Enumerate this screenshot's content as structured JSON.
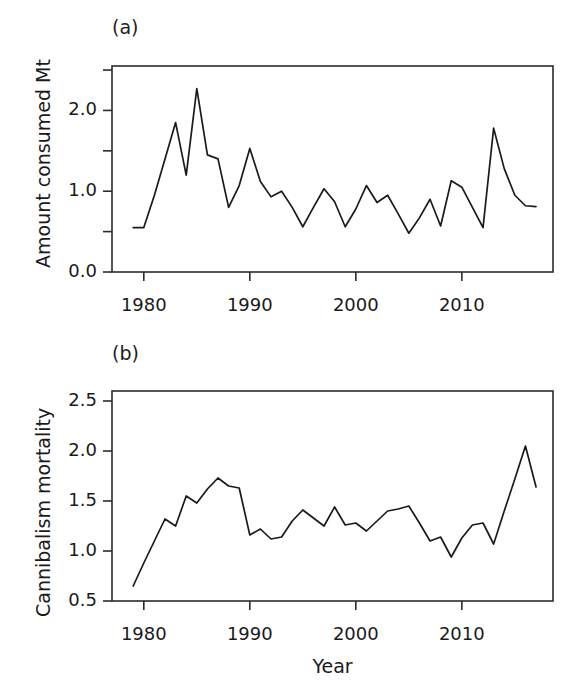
{
  "figure": {
    "background": "#ffffff",
    "line_color": "#1a1a1a",
    "axis_color": "#2b2b2b",
    "panels": [
      {
        "key": "a",
        "label": "(a)",
        "ylabel": "Amount consumed Mt",
        "xlabel": ""
      },
      {
        "key": "b",
        "label": "(b)",
        "ylabel": "Cannibalism mortality",
        "xlabel": "Year"
      }
    ]
  },
  "chart_data": [
    {
      "type": "line",
      "panel": "a",
      "title": "(a)",
      "xlabel": "",
      "ylabel": "Amount consumed Mt",
      "xlim": [
        1977.0,
        1919.0
      ],
      "ylim": [
        0.0,
        2.55
      ],
      "xticks": [
        1980,
        1990,
        2000,
        2010
      ],
      "xtick_labels": [
        "1980",
        "1990",
        "2000",
        "2010"
      ],
      "yticks": [
        0.0,
        0.5,
        1.0,
        1.5,
        2.0,
        2.5
      ],
      "ytick_labels": [
        "0.0",
        "",
        "1.0",
        "",
        "2.0",
        ""
      ],
      "grid": false,
      "legend": "none",
      "x": [
        1979,
        1980,
        1981,
        1982,
        1983,
        1984,
        1985,
        1986,
        1987,
        1988,
        1989,
        1990,
        1991,
        1992,
        1993,
        1994,
        1995,
        1996,
        1997,
        1998,
        1999,
        2000,
        2001,
        2002,
        2003,
        2004,
        2005,
        2006,
        2007,
        2008,
        2009,
        2010,
        2011,
        2012,
        2013,
        2014,
        2015,
        2016,
        2017
      ],
      "values": [
        0.55,
        0.55,
        0.95,
        1.4,
        1.85,
        1.2,
        2.27,
        1.45,
        1.4,
        0.8,
        1.07,
        1.53,
        1.12,
        0.93,
        1.0,
        0.8,
        0.56,
        0.8,
        1.03,
        0.87,
        0.56,
        0.78,
        1.07,
        0.86,
        0.95,
        0.72,
        0.48,
        0.67,
        0.9,
        0.57,
        1.13,
        1.05,
        0.8,
        0.55,
        1.78,
        1.28,
        0.95,
        0.82,
        0.81
      ]
    },
    {
      "type": "line",
      "panel": "b",
      "title": "(b)",
      "xlabel": "Year",
      "ylabel": "Cannibalism mortality",
      "xlim": [
        1977.0,
        1919.0
      ],
      "ylim": [
        0.5,
        2.6
      ],
      "xticks": [
        1980,
        1990,
        2000,
        2010
      ],
      "xtick_labels": [
        "1980",
        "1990",
        "2000",
        "2010"
      ],
      "yticks": [
        0.5,
        1.0,
        1.5,
        2.0,
        2.5
      ],
      "ytick_labels": [
        "0.5",
        "1.0",
        "1.5",
        "2.0",
        "2.5"
      ],
      "grid": false,
      "legend": "none",
      "x": [
        1979,
        1980,
        1981,
        1982,
        1983,
        1984,
        1985,
        1986,
        1987,
        1988,
        1989,
        1990,
        1991,
        1992,
        1993,
        1994,
        1995,
        1996,
        1997,
        1998,
        1999,
        2000,
        2001,
        2002,
        2003,
        2004,
        2005,
        2006,
        2007,
        2008,
        2009,
        2010,
        2011,
        2012,
        2013,
        2014,
        2015,
        2016,
        2017
      ],
      "values": [
        0.65,
        0.88,
        1.1,
        1.32,
        1.25,
        1.55,
        1.48,
        1.62,
        1.73,
        1.65,
        1.63,
        1.16,
        1.22,
        1.12,
        1.14,
        1.3,
        1.41,
        1.33,
        1.25,
        1.44,
        1.26,
        1.28,
        1.2,
        1.3,
        1.4,
        1.42,
        1.45,
        1.28,
        1.1,
        1.14,
        0.94,
        1.13,
        1.26,
        1.28,
        1.07,
        1.4,
        1.72,
        2.05,
        1.64
      ]
    }
  ]
}
